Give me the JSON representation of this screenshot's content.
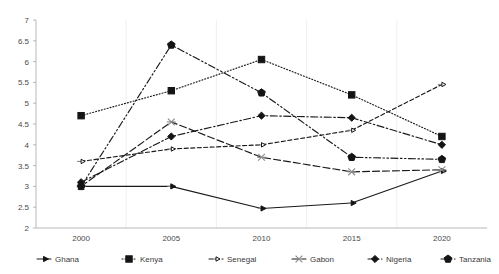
{
  "chart_data": {
    "type": "line",
    "title": "",
    "xlabel": "",
    "ylabel": "",
    "categories": [
      "2000",
      "2005",
      "2010",
      "2015",
      "2020"
    ],
    "x": [
      2000,
      2005,
      2010,
      2015,
      2020
    ],
    "ylim": [
      2,
      7
    ],
    "y_ticks": [
      "2",
      "2.5",
      "3",
      "3.5",
      "4",
      "4.5",
      "5",
      "5.5",
      "6",
      "6.5",
      "7"
    ],
    "y_tick_values": [
      2,
      2.5,
      3,
      3.5,
      4,
      4.5,
      5,
      5.5,
      6,
      6.5,
      7
    ],
    "grid": "vertical-light",
    "legend_position": "bottom",
    "series": [
      {
        "name": "Ghana",
        "marker": "arrow-right",
        "dash": "solid",
        "values": [
          3.0,
          3.0,
          2.47,
          2.6,
          3.37
        ]
      },
      {
        "name": "Kenya",
        "marker": "square-filled",
        "dash": "dotted",
        "values": [
          4.7,
          5.3,
          6.05,
          5.2,
          4.2
        ]
      },
      {
        "name": "Senegal",
        "marker": "arrow-small",
        "dash": "dashed",
        "values": [
          3.6,
          3.9,
          4.0,
          4.35,
          5.45
        ]
      },
      {
        "name": "Gabon",
        "marker": "cross",
        "dash": "long-dash",
        "values": [
          3.0,
          4.55,
          3.7,
          3.35,
          3.4
        ]
      },
      {
        "name": "Nigeria",
        "marker": "diamond",
        "dash": "dash-dot",
        "values": [
          3.1,
          4.2,
          4.7,
          4.65,
          4.0
        ]
      },
      {
        "name": "Tanzania",
        "marker": "pentagon-filled",
        "dash": "dash-dot-dot",
        "values": [
          3.0,
          6.4,
          5.25,
          3.7,
          3.65
        ]
      }
    ]
  },
  "legend": {
    "items": [
      {
        "label": "Ghana"
      },
      {
        "label": "Kenya"
      },
      {
        "label": "Senegal"
      },
      {
        "label": "Gabon"
      },
      {
        "label": "Nigeria"
      },
      {
        "label": "Tanzania"
      }
    ]
  },
  "colors": {
    "line": "#141414",
    "axis": "#a6a6a6",
    "grid": "#e9e9e9",
    "text": "#3a3a3a",
    "background": "#ffffff"
  }
}
